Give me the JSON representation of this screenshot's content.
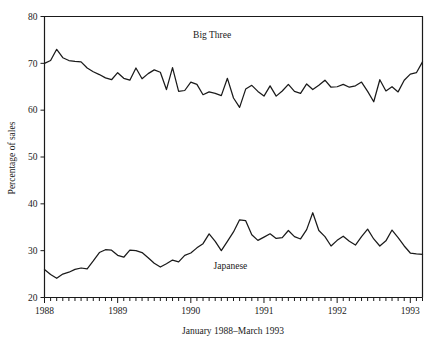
{
  "chart_data": {
    "type": "line",
    "title": "",
    "xlabel": "January 1988–March 1993",
    "ylabel": "Percentage of sales",
    "ylim": [
      20,
      80
    ],
    "yticks": [
      20,
      30,
      40,
      50,
      60,
      70,
      80
    ],
    "ytick_labels": [
      "20",
      "30",
      "40",
      "50",
      "60",
      "70",
      "80"
    ],
    "xtick_labels": [
      "1988",
      "1989",
      "1990",
      "1991",
      "1992",
      "1993"
    ],
    "xtick_positions": [
      0,
      12,
      24,
      36,
      48,
      60
    ],
    "x_minor_ticks_per_year": 12,
    "n_points": 63,
    "grid": false,
    "legend": "inline-labels",
    "annotations": [
      {
        "text": "Big Three",
        "x": 27.5,
        "y": 75.5
      },
      {
        "text": "Japanese",
        "x": 30.5,
        "y": 26.0
      }
    ],
    "series": [
      {
        "name": "Big Three",
        "label_text": "Big Three",
        "color": "#1a1a1a",
        "values": [
          70.0,
          70.6,
          73.0,
          71.2,
          70.6,
          70.4,
          70.3,
          69.0,
          68.2,
          67.6,
          66.9,
          66.5,
          68.0,
          66.8,
          66.4,
          69.0,
          66.7,
          67.8,
          68.6,
          68.1,
          64.4,
          69.1,
          64.0,
          64.2,
          66.0,
          65.5,
          63.3,
          63.9,
          63.6,
          63.1,
          66.8,
          62.6,
          60.6,
          64.5,
          65.3,
          64.0,
          63.0,
          65.2,
          63.0,
          64.1,
          65.5,
          64.0,
          63.6,
          65.6,
          64.4,
          65.3,
          66.4,
          64.9,
          65.0,
          65.5,
          64.9,
          65.2,
          66.0,
          64.0,
          61.8,
          66.5,
          64.1,
          65.0,
          63.9,
          66.4,
          67.7,
          68.0,
          70.3
        ]
      },
      {
        "name": "Japanese",
        "label_text": "Japanese",
        "color": "#1a1a1a",
        "values": [
          26.0,
          24.9,
          24.1,
          25.0,
          25.4,
          26.0,
          26.3,
          26.1,
          27.8,
          29.6,
          30.2,
          30.1,
          29.0,
          28.6,
          30.1,
          30.0,
          29.6,
          28.5,
          27.3,
          26.5,
          27.2,
          28.0,
          27.6,
          29.0,
          29.5,
          30.6,
          31.5,
          33.6,
          32.0,
          30.0,
          32.0,
          34.0,
          36.6,
          36.4,
          33.4,
          32.2,
          32.9,
          33.6,
          32.6,
          32.8,
          34.3,
          33.0,
          32.5,
          34.5,
          38.1,
          34.3,
          33.0,
          31.0,
          32.2,
          33.1,
          32.0,
          31.2,
          33.0,
          34.6,
          32.5,
          31.0,
          32.1,
          34.4,
          32.8,
          31.0,
          29.5,
          29.3,
          29.2
        ]
      }
    ]
  },
  "figure": {
    "background": "#ffffff",
    "ink": "#1a1a1a"
  }
}
